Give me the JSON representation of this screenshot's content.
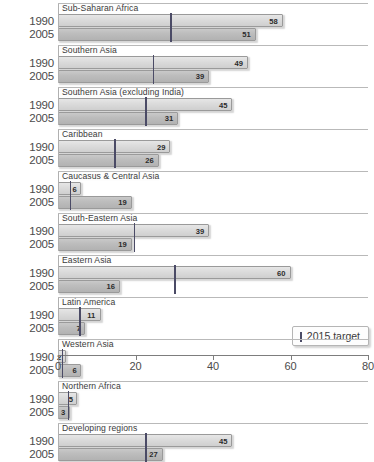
{
  "legend": {
    "label": "2015 target",
    "marker_color": "#4b4b66"
  },
  "axis": {
    "ticks": [
      "0",
      "20",
      "40",
      "60",
      "80"
    ],
    "tick_values": [
      0,
      20,
      40,
      60,
      80
    ],
    "min": 0,
    "max": 80
  },
  "series_years": [
    "1990",
    "2005"
  ],
  "chart_data": {
    "type": "bar",
    "orientation": "horizontal",
    "title": "",
    "xlabel": "",
    "ylabel": "",
    "xlim": [
      0,
      80
    ],
    "grid": false,
    "legend": [
      "2015 target"
    ],
    "legend_position": "bottom-right",
    "categories": [
      "Sub-Saharan Africa",
      "Southern Asia",
      "Southern Asia (excluding India)",
      "Caribbean",
      "Caucasus & Central Asia",
      "South-Eastern Asia",
      "Eastern Asia",
      "Latin America",
      "Western Asia",
      "Northern Africa",
      "Developing regions"
    ],
    "series": [
      {
        "name": "1990",
        "values": [
          58,
          49,
          45,
          29,
          6,
          39,
          60,
          11,
          2,
          5,
          45
        ]
      },
      {
        "name": "2005",
        "values": [
          51,
          39,
          31,
          26,
          19,
          19,
          16,
          7,
          6,
          3,
          27
        ]
      }
    ],
    "targets": [
      29,
      24.5,
      22.5,
      14.5,
      3,
      19.5,
      30,
      5.5,
      1,
      2.5,
      22.5
    ],
    "target_label": "2015 target"
  },
  "groups": [
    {
      "label": "Sub-Saharan Africa",
      "v1990": 58,
      "v2005": 51,
      "target": 29
    },
    {
      "label": "Southern Asia",
      "v1990": 49,
      "v2005": 39,
      "target": 24.5
    },
    {
      "label": "Southern Asia (excluding India)",
      "v1990": 45,
      "v2005": 31,
      "target": 22.5
    },
    {
      "label": "Caribbean",
      "v1990": 29,
      "v2005": 26,
      "target": 14.5
    },
    {
      "label": "Caucasus & Central Asia",
      "v1990": 6,
      "v2005": 19,
      "target": 3
    },
    {
      "label": "South-Eastern Asia",
      "v1990": 39,
      "v2005": 19,
      "target": 19.5
    },
    {
      "label": "Eastern Asia",
      "v1990": 60,
      "v2005": 16,
      "target": 30
    },
    {
      "label": "Latin America",
      "v1990": 11,
      "v2005": 7,
      "target": 5.5
    },
    {
      "label": "Western Asia",
      "v1990": 2,
      "v2005": 6,
      "target": 1
    },
    {
      "label": "Northern Africa",
      "v1990": 5,
      "v2005": 3,
      "target": 2.5
    },
    {
      "label": "Developing regions",
      "v1990": 45,
      "v2005": 27,
      "target": 22.5
    }
  ]
}
